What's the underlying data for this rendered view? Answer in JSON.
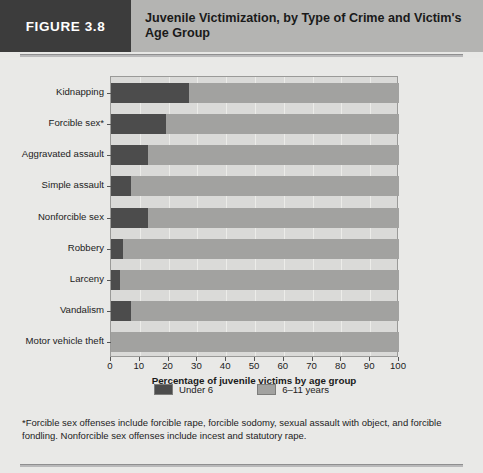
{
  "figure": {
    "tag": "FIGURE 3.8",
    "title": "Juvenile Victimization, by Type of Crime and Victim's Age Group"
  },
  "legend": {
    "items": [
      {
        "label": "Under 6",
        "color": "#4c4c4c",
        "key": "under6"
      },
      {
        "label": "6–11 years",
        "color": "#a2a2a0",
        "key": "age6to11"
      }
    ]
  },
  "footnote": "*Forcible sex offenses include forcible rape, forcible sodomy, sexual assault with object, and forcible fondling.  Nonforcible sex offenses include incest and statutory rape.",
  "chart_data": {
    "type": "bar",
    "orientation": "horizontal",
    "stacked": true,
    "title": "Juvenile Victimization, by Type of Crime and Victim's Age Group",
    "xlabel": "Percentage of juvenile victims by age group",
    "ylabel": "",
    "xlim": [
      0,
      100
    ],
    "xticks": [
      0,
      10,
      20,
      30,
      40,
      50,
      60,
      70,
      80,
      90,
      100
    ],
    "grid": true,
    "legend_position": "bottom-center",
    "categories": [
      "Kidnapping",
      "Forcible sex*",
      "Aggravated assault",
      "Simple assault",
      "Nonforcible sex",
      "Robbery",
      "Larceny",
      "Vandalism",
      "Motor vehicle theft"
    ],
    "series": [
      {
        "name": "Under 6",
        "color": "#4c4c4c",
        "values": [
          27,
          19,
          13,
          7,
          13,
          4,
          3,
          7,
          0
        ]
      },
      {
        "name": "6–11 years",
        "color": "#a2a2a0",
        "values": [
          73,
          81,
          87,
          93,
          87,
          96,
          97,
          93,
          100
        ]
      }
    ]
  }
}
